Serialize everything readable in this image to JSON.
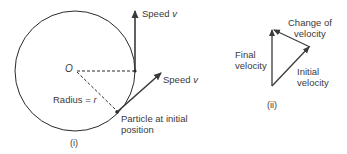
{
  "figure_i": {
    "caption": "(i)",
    "center_label": "O",
    "radius_label": "Radius = ",
    "radius_symbol": "r",
    "speed_top_label": "Speed ",
    "speed_top_symbol": "v",
    "speed_right_label": "Speed ",
    "speed_right_symbol": "v",
    "particle_label_line1": "Particle at initial",
    "particle_label_line2": "position"
  },
  "figure_ii": {
    "caption": "(ii)",
    "change_label_line1": "Change of",
    "change_label_line2": "velocity",
    "final_label_line1": "Final",
    "final_label_line2": "velocity",
    "initial_label_line1": "Initial",
    "initial_label_line2": "velocity"
  },
  "colors": {
    "line": "#2a2a2a",
    "arrow": "#3a3a3a",
    "text": "#3a3a3a"
  }
}
